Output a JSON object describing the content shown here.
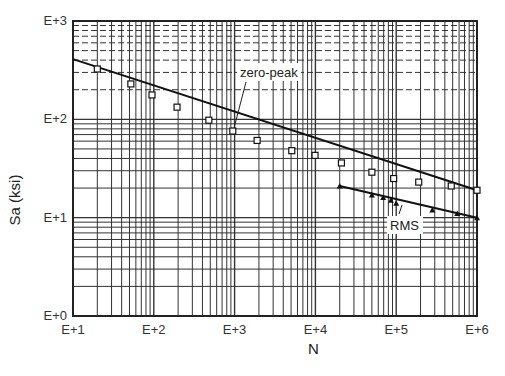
{
  "chart_data": {
    "type": "line",
    "title": "",
    "xlabel": "N",
    "ylabel": "Sa (ksi)",
    "xscale": "log",
    "yscale": "log",
    "xlim": [
      10,
      1000000
    ],
    "ylim": [
      1,
      1000
    ],
    "grid": true,
    "x_tick_labels": [
      "E+1",
      "E+2",
      "E+3",
      "E+4",
      "E+5",
      "E+6"
    ],
    "y_tick_labels": [
      "E+0",
      "E+1",
      "E+2",
      "E+3"
    ],
    "legend": "none (inline annotations)",
    "series": [
      {
        "name": "zero-peak",
        "marker": "square",
        "fit_line": {
          "x": [
            10,
            1000000
          ],
          "y": [
            410,
            19
          ]
        },
        "x": [
          20,
          52,
          95,
          194,
          480,
          950,
          1900,
          5100,
          9900,
          21000,
          50000,
          93000,
          190000,
          480000,
          1000000
        ],
        "y": [
          325,
          229,
          177,
          133,
          98,
          76,
          61,
          48,
          43,
          36,
          29,
          25,
          23,
          21,
          19
        ]
      },
      {
        "name": "RMS",
        "marker": "triangle",
        "fit_line": {
          "x": [
            20000,
            1000000
          ],
          "y": [
            21,
            10
          ]
        },
        "x": [
          20000,
          50000,
          69000,
          86000,
          100000,
          280000,
          570000,
          1000000
        ],
        "y": [
          21,
          17,
          16,
          15,
          14,
          12,
          11,
          10
        ]
      }
    ],
    "annotations": [
      {
        "text": "zero-peak",
        "points_to": {
          "x": 1000,
          "y": 78
        }
      },
      {
        "text": "RMS",
        "points_to": {
          "x": 100000,
          "y": 14
        }
      }
    ]
  },
  "labels": {
    "xlabel": "N",
    "ylabel": "Sa (ksi)",
    "ann_zero_peak": "zero-peak",
    "ann_rms": "RMS"
  }
}
